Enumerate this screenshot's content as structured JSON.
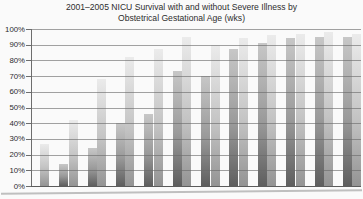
{
  "title": {
    "line1": "2001–2005 NICU Survival with and without Severe Illness by",
    "line2": "Obstetrical Gestational Age (wks)"
  },
  "y_axis": {
    "labels": [
      "100%",
      "90%",
      "80%",
      "70%",
      "60%",
      "50%",
      "40%",
      "30%",
      "20%",
      "10%",
      "0%"
    ]
  },
  "chart_data": {
    "type": "bar",
    "title": "2001–2005 NICU Survival with and without Severe Illness by Obstetrical Gestational Age (wks)",
    "xlabel": "",
    "ylabel": "",
    "ylim": [
      0,
      100
    ],
    "ytick_step": 10,
    "yticklabels": [
      "100%",
      "90%",
      "80%",
      "70%",
      "60%",
      "50%",
      "40%",
      "30%",
      "20%",
      "10%",
      "0%"
    ],
    "grid": true,
    "gridlines_over_bars": true,
    "legend_position": "none",
    "categories": [
      "",
      "",
      "",
      "",
      "",
      "",
      "",
      "",
      "",
      "",
      "",
      ""
    ],
    "series": [
      {
        "name": "left-dark-bars",
        "values": [
          0,
          14,
          24,
          40,
          46,
          73,
          70,
          87,
          91,
          94,
          95,
          95
        ]
      },
      {
        "name": "right-light-bars",
        "values": [
          27,
          42,
          68,
          82,
          87,
          95,
          90,
          94,
          96,
          97,
          98,
          97
        ]
      }
    ],
    "colors": {
      "dark_bar_top": "#c7c7c7",
      "dark_bar_bottom": "#5e5e5e",
      "light_bar_top": "#ebebeb",
      "light_bar_bottom": "#949494",
      "gridline": "#696969",
      "background": "#fafafa",
      "text": "#2d2d2d"
    }
  }
}
